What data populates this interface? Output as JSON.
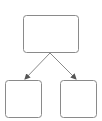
{
  "diagram": {
    "type": "tree",
    "stroke_color": "#8a8a8a",
    "fill_color": "#ffffff",
    "nodes": [
      {
        "id": "root",
        "label": "",
        "x": 23.5,
        "y": 15.5,
        "w": 55,
        "h": 37
      },
      {
        "id": "child-left",
        "label": "",
        "x": 5.5,
        "y": 80.5,
        "w": 36,
        "h": 37
      },
      {
        "id": "child-right",
        "label": "",
        "x": 60.5,
        "y": 80.5,
        "w": 36,
        "h": 37
      }
    ],
    "edges": [
      {
        "from": "root",
        "to": "child-left"
      },
      {
        "from": "root",
        "to": "child-right"
      }
    ]
  }
}
